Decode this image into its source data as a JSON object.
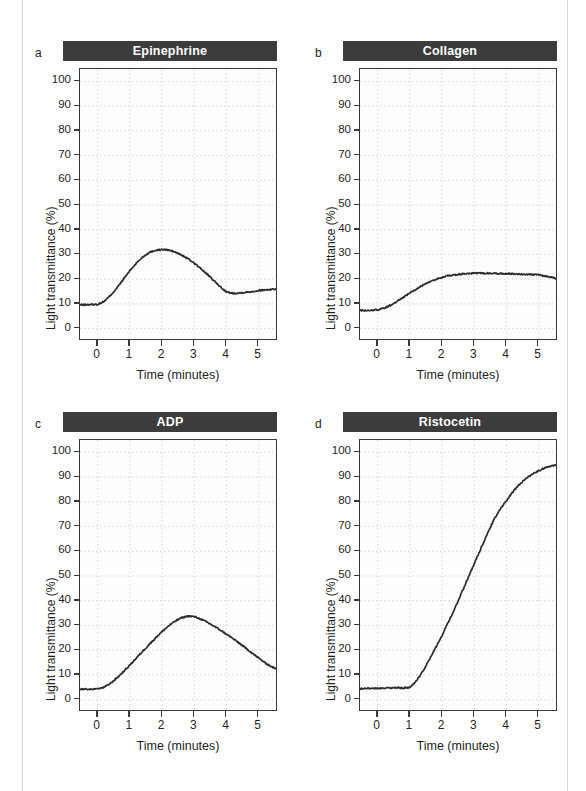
{
  "figure": {
    "shared": {
      "ylabel": "Light transmittance (%)",
      "xlabel": "Time (minutes)",
      "yticks": [
        "0",
        "10",
        "20",
        "30",
        "40",
        "50",
        "60",
        "70",
        "80",
        "90",
        "100"
      ],
      "xticks": [
        "0",
        "1",
        "2",
        "3",
        "4",
        "5"
      ],
      "title_bar_color": "#3c3c3c",
      "curve_color": "#2b2b2b",
      "grid_color": "#cfcfcf"
    },
    "panels": [
      {
        "letter": "a",
        "title": "Epinephrine"
      },
      {
        "letter": "b",
        "title": "Collagen"
      },
      {
        "letter": "c",
        "title": "ADP"
      },
      {
        "letter": "d",
        "title": "Ristocetin"
      }
    ]
  },
  "chart_data": [
    {
      "type": "line",
      "panel": "a",
      "title": "Epinephrine",
      "xlabel": "Time (minutes)",
      "ylabel": "Light transmittance (%)",
      "xlim": [
        -0.55,
        5.6
      ],
      "ylim": [
        -5,
        105
      ],
      "xticks": [
        0,
        1,
        2,
        3,
        4,
        5
      ],
      "yticks": [
        0,
        10,
        20,
        30,
        40,
        50,
        60,
        70,
        80,
        90,
        100
      ],
      "grid": true,
      "legend": "none",
      "x": [
        -0.55,
        -0.3,
        0,
        0.2,
        0.4,
        0.6,
        0.8,
        1.0,
        1.2,
        1.4,
        1.6,
        1.8,
        2.0,
        2.2,
        2.4,
        2.6,
        2.8,
        3.0,
        3.2,
        3.4,
        3.6,
        3.8,
        4.0,
        4.2,
        4.4,
        4.6,
        4.8,
        5.0,
        5.2,
        5.4,
        5.6
      ],
      "y": [
        9.6,
        9.7,
        9.8,
        11.0,
        13.5,
        16.5,
        20.0,
        23.5,
        26.5,
        29.0,
        30.8,
        31.7,
        32.0,
        31.8,
        31.0,
        29.8,
        28.3,
        26.5,
        24.3,
        22.0,
        19.5,
        17.0,
        14.8,
        14.3,
        14.4,
        14.7,
        15.0,
        15.4,
        15.7,
        15.9,
        16.1
      ]
    },
    {
      "type": "line",
      "panel": "b",
      "title": "Collagen",
      "xlabel": "Time (minutes)",
      "ylabel": "Light transmittance (%)",
      "xlim": [
        -0.55,
        5.6
      ],
      "ylim": [
        -5,
        105
      ],
      "xticks": [
        0,
        1,
        2,
        3,
        4,
        5
      ],
      "yticks": [
        0,
        10,
        20,
        30,
        40,
        50,
        60,
        70,
        80,
        90,
        100
      ],
      "grid": true,
      "legend": "none",
      "x": [
        -0.55,
        -0.3,
        0,
        0.2,
        0.4,
        0.6,
        0.8,
        1.0,
        1.2,
        1.4,
        1.6,
        1.8,
        2.0,
        2.2,
        2.4,
        2.6,
        2.8,
        3.0,
        3.2,
        3.4,
        3.6,
        3.8,
        4.0,
        4.2,
        4.4,
        4.6,
        4.8,
        5.0,
        5.2,
        5.4,
        5.6
      ],
      "y": [
        7.3,
        7.4,
        7.6,
        8.3,
        9.5,
        11.0,
        12.7,
        14.4,
        16.0,
        17.5,
        18.8,
        19.9,
        20.8,
        21.4,
        21.8,
        22.1,
        22.3,
        22.4,
        22.4,
        22.4,
        22.3,
        22.3,
        22.2,
        22.2,
        22.1,
        22.0,
        21.9,
        21.7,
        21.3,
        20.7,
        20.2
      ]
    },
    {
      "type": "line",
      "panel": "c",
      "title": "ADP",
      "xlabel": "Time (minutes)",
      "ylabel": "Light transmittance (%)",
      "xlim": [
        -0.55,
        5.6
      ],
      "ylim": [
        -5,
        105
      ],
      "xticks": [
        0,
        1,
        2,
        3,
        4,
        5
      ],
      "yticks": [
        0,
        10,
        20,
        30,
        40,
        50,
        60,
        70,
        80,
        90,
        100
      ],
      "grid": true,
      "legend": "none",
      "x": [
        -0.55,
        -0.3,
        0,
        0.2,
        0.4,
        0.6,
        0.8,
        1.0,
        1.2,
        1.4,
        1.6,
        1.8,
        2.0,
        2.2,
        2.4,
        2.6,
        2.8,
        3.0,
        3.2,
        3.4,
        3.6,
        3.8,
        4.0,
        4.2,
        4.4,
        4.6,
        4.8,
        5.0,
        5.2,
        5.4,
        5.6
      ],
      "y": [
        4.2,
        4.2,
        4.3,
        5.0,
        6.6,
        8.8,
        11.3,
        14.0,
        16.8,
        19.6,
        22.3,
        25.0,
        27.5,
        29.8,
        31.7,
        33.1,
        33.8,
        33.6,
        32.6,
        31.3,
        29.8,
        28.2,
        26.5,
        24.7,
        22.8,
        20.8,
        18.8,
        16.8,
        14.9,
        13.3,
        12.1
      ]
    },
    {
      "type": "line",
      "panel": "d",
      "title": "Ristocetin",
      "xlabel": "Time (minutes)",
      "ylabel": "Light transmittance (%)",
      "xlim": [
        -0.55,
        5.6
      ],
      "ylim": [
        -5,
        105
      ],
      "xticks": [
        0,
        1,
        2,
        3,
        4,
        5
      ],
      "yticks": [
        0,
        10,
        20,
        30,
        40,
        50,
        60,
        70,
        80,
        90,
        100
      ],
      "grid": true,
      "legend": "none",
      "x": [
        -0.55,
        -0.3,
        0,
        0.2,
        0.4,
        0.6,
        0.8,
        1.0,
        1.2,
        1.4,
        1.6,
        1.8,
        2.0,
        2.2,
        2.4,
        2.6,
        2.8,
        3.0,
        3.2,
        3.4,
        3.6,
        3.8,
        4.0,
        4.2,
        4.4,
        4.6,
        4.8,
        5.0,
        5.2,
        5.4,
        5.6
      ],
      "y": [
        4.4,
        4.6,
        4.5,
        4.7,
        4.6,
        4.8,
        4.7,
        5.0,
        7.5,
        11.5,
        16.0,
        21.0,
        26.0,
        31.5,
        37.0,
        43.0,
        49.0,
        55.0,
        61.0,
        67.0,
        72.5,
        77.0,
        80.5,
        84.0,
        87.0,
        89.4,
        91.2,
        92.6,
        93.7,
        94.5,
        95.0
      ]
    }
  ]
}
